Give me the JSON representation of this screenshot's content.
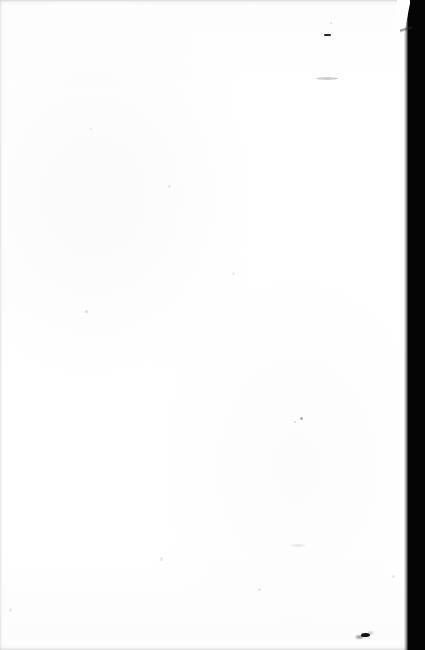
{
  "page": {
    "kind": "scanned-document-page",
    "content_state": "blank",
    "background_color": "#fefefe",
    "width_px": 425,
    "height_px": 650,
    "visible_text": ""
  },
  "scan_artifacts": {
    "gutter": {
      "name": "right-edge-black-band",
      "color": "#050505",
      "side": "right",
      "width_px": 17,
      "notch": {
        "name": "top-diagonal-notch",
        "height_px": 56
      }
    },
    "edges": [
      {
        "name": "top-edge-shadow",
        "side": "top",
        "color": "#a8a8aa"
      },
      {
        "name": "left-edge-shadow",
        "side": "left",
        "color": "#babab e"
      },
      {
        "name": "bottom-edge-shadow",
        "side": "bottom",
        "color": "#b0b0b4"
      }
    ],
    "marks": [
      {
        "name": "ink-blot",
        "x": 365,
        "y": 636,
        "tone": "dark",
        "w": 9,
        "h": 4
      },
      {
        "name": "dash-mark",
        "x": 327,
        "y": 35,
        "tone": "dark",
        "w": 7,
        "h": 2
      },
      {
        "name": "smudge-upper-right",
        "x": 325,
        "y": 78,
        "tone": "mid",
        "w": 18,
        "h": 3
      },
      {
        "name": "speck-mid-right",
        "x": 300,
        "y": 417,
        "tone": "mid",
        "w": 3,
        "h": 3
      },
      {
        "name": "speck-mid-right-b",
        "x": 294,
        "y": 421,
        "tone": "faint",
        "w": 2,
        "h": 2
      },
      {
        "name": "speck-left",
        "x": 85,
        "y": 310,
        "tone": "faint",
        "w": 3,
        "h": 3
      },
      {
        "name": "speck-lower-right",
        "x": 297,
        "y": 545,
        "tone": "faint",
        "w": 12,
        "h": 3
      },
      {
        "name": "speck-center",
        "x": 232,
        "y": 272,
        "tone": "faint",
        "w": 3,
        "h": 3
      },
      {
        "name": "speck-lower-left",
        "x": 160,
        "y": 558,
        "tone": "faint",
        "w": 3,
        "h": 4
      },
      {
        "name": "speck-upper-mid",
        "x": 168,
        "y": 185,
        "tone": "faint",
        "w": 3,
        "h": 3
      },
      {
        "name": "speck-upper-left",
        "x": 90,
        "y": 128,
        "tone": "faint",
        "w": 2,
        "h": 2
      },
      {
        "name": "speck-top-right",
        "x": 330,
        "y": 22,
        "tone": "faint",
        "w": 2,
        "h": 2
      },
      {
        "name": "speck-bottom-left",
        "x": 9,
        "y": 608,
        "tone": "faint",
        "w": 3,
        "h": 4
      },
      {
        "name": "speck-mid-low",
        "x": 258,
        "y": 588,
        "tone": "faint",
        "w": 3,
        "h": 3
      },
      {
        "name": "speck-right-low",
        "x": 392,
        "y": 575,
        "tone": "faint",
        "w": 3,
        "h": 3
      }
    ]
  }
}
